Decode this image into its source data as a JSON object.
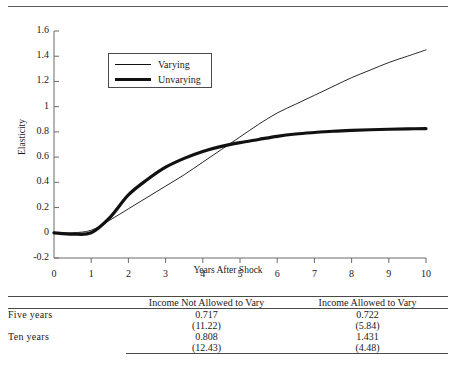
{
  "figure": {
    "ghost_text": "",
    "ylabel": "Elasticity",
    "xlabel": "Years After Shock",
    "legend": {
      "entries": [
        {
          "label": "Varying",
          "style": "thin-line",
          "color": "#111111"
        },
        {
          "label": "Unvarying",
          "style": "thick-line",
          "color": "#111111"
        }
      ]
    }
  },
  "chart_data": {
    "type": "line",
    "title": "",
    "xlabel": "Years After Shock",
    "ylabel": "Elasticity",
    "xlim": [
      0,
      10
    ],
    "ylim": [
      -0.2,
      1.6
    ],
    "xticks": [
      0,
      1,
      2,
      3,
      4,
      5,
      6,
      7,
      8,
      9,
      10
    ],
    "ytick_labels": [
      "1.6",
      "1.4",
      "1.2",
      "1",
      "0.8",
      "0.6",
      "0.4",
      "0.2",
      "0",
      "-0.2"
    ],
    "ytick_values": [
      1.6,
      1.4,
      1.2,
      1.0,
      0.8,
      0.6,
      0.4,
      0.2,
      0.0,
      -0.2
    ],
    "grid": false,
    "legend_position": "upper-left-inside",
    "x": [
      0,
      0.5,
      1,
      1.5,
      2,
      2.5,
      3,
      3.5,
      4,
      4.5,
      5,
      5.5,
      6,
      6.5,
      7,
      7.5,
      8,
      8.5,
      9,
      9.5,
      10
    ],
    "series": [
      {
        "name": "Varying",
        "line_width": "thin",
        "color": "#111111",
        "values": [
          0.0,
          0.0,
          0.02,
          0.1,
          0.19,
          0.28,
          0.37,
          0.46,
          0.56,
          0.66,
          0.76,
          0.86,
          0.95,
          1.02,
          1.09,
          1.16,
          1.23,
          1.29,
          1.35,
          1.4,
          1.45
        ]
      },
      {
        "name": "Unvarying",
        "line_width": "thick",
        "color": "#111111",
        "values": [
          0.0,
          -0.01,
          0.0,
          0.12,
          0.3,
          0.42,
          0.52,
          0.59,
          0.645,
          0.685,
          0.715,
          0.74,
          0.765,
          0.783,
          0.795,
          0.805,
          0.812,
          0.817,
          0.821,
          0.824,
          0.826
        ]
      }
    ],
    "annotations": [
      {
        "text": "curves cross near year 4.7 at elasticity 0.72"
      }
    ]
  },
  "table": {
    "columns": [
      "",
      "Income Not Allowed to Vary",
      "Income Allowed to Vary"
    ],
    "rows": [
      {
        "stub": "Five years",
        "values": [
          "0.717",
          "0.722"
        ],
        "std_errors": [
          "(11.22)",
          "(5.84)"
        ]
      },
      {
        "stub": "Ten years",
        "values": [
          "0.808",
          "1.431"
        ],
        "std_errors": [
          "(12.43)",
          "(4.48)"
        ]
      }
    ]
  }
}
